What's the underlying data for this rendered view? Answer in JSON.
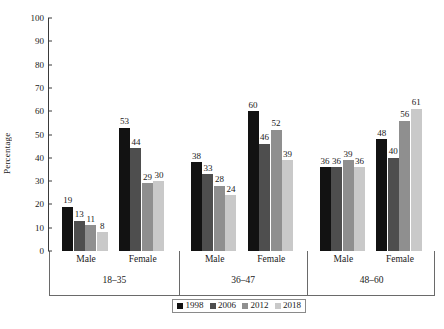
{
  "chart_data": {
    "type": "bar",
    "title": "",
    "xlabel": "",
    "ylabel": "Percentage",
    "ylim": [
      0,
      100
    ],
    "ytick_step": 10,
    "ytick_labels": [
      "0",
      "10",
      "20",
      "30",
      "40",
      "50",
      "60",
      "70",
      "80",
      "90",
      "100"
    ],
    "grid": false,
    "legend_position": "bottom-center",
    "legend_entries": [
      "1998",
      "2006",
      "2012",
      "2018"
    ],
    "series_colors": [
      "#121212",
      "#4e4e4e",
      "#8f8f8f",
      "#c9c9c9"
    ],
    "group_labels": [
      "18–35",
      "36–47",
      "48–60"
    ],
    "subgroup_labels": [
      "Male",
      "Female"
    ],
    "categories": [
      "18–35 Male",
      "18–35 Female",
      "36–47 Male",
      "36–47 Female",
      "48–60 Male",
      "48–60 Female"
    ],
    "series": [
      {
        "name": "1998",
        "color": "#121212",
        "values": [
          19,
          53,
          38,
          60,
          36,
          48
        ]
      },
      {
        "name": "2006",
        "color": "#4e4e4e",
        "values": [
          13,
          44,
          33,
          46,
          36,
          40
        ]
      },
      {
        "name": "2012",
        "color": "#8f8f8f",
        "values": [
          11,
          29,
          28,
          52,
          39,
          56
        ]
      },
      {
        "name": "2018",
        "color": "#c9c9c9",
        "values": [
          8,
          30,
          24,
          39,
          36,
          61
        ]
      }
    ],
    "groups": [
      {
        "age": "18–35",
        "subgroups": [
          {
            "sex": "Male",
            "values": [
              19,
              13,
              11,
              8
            ]
          },
          {
            "sex": "Female",
            "values": [
              53,
              44,
              29,
              30
            ]
          }
        ]
      },
      {
        "age": "36–47",
        "subgroups": [
          {
            "sex": "Male",
            "values": [
              38,
              33,
              28,
              24
            ]
          },
          {
            "sex": "Female",
            "values": [
              60,
              46,
              52,
              39
            ]
          }
        ]
      },
      {
        "age": "48–60",
        "subgroups": [
          {
            "sex": "Male",
            "values": [
              36,
              36,
              39,
              36
            ]
          },
          {
            "sex": "Female",
            "values": [
              48,
              40,
              56,
              61
            ]
          }
        ]
      }
    ]
  },
  "axis": {
    "ylabel": "Percentage",
    "color": "#3a3a3a"
  }
}
